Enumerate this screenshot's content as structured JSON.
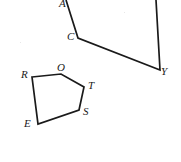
{
  "figure": {
    "background_color": "#ffffff",
    "stroke_color": "#1a1a1a",
    "label_color": "#1a1a1a",
    "width": 181,
    "height": 162,
    "shapes": [
      {
        "name": "upper-quadrilateral",
        "type": "polyline-open",
        "description": "Partial quadrilateral whose top side is cut off by the image edge",
        "points": "66,0 78,38 160,70 156,0",
        "closed": false
      },
      {
        "name": "lower-pentagon",
        "type": "polygon",
        "description": "Closed pentagon labelled R, O, T, S, E",
        "points": "32,77 61,74 84,87 79,110 38,124",
        "closed": true
      }
    ],
    "labels": [
      {
        "id": "A",
        "text": "A",
        "x": 59,
        "y": -2,
        "shape": "upper-quadrilateral"
      },
      {
        "id": "C",
        "text": "C",
        "x": 67,
        "y": 31,
        "shape": "upper-quadrilateral"
      },
      {
        "id": "Y",
        "text": "Y",
        "x": 161,
        "y": 66,
        "shape": "upper-quadrilateral"
      },
      {
        "id": "R",
        "text": "R",
        "x": 21,
        "y": 69,
        "shape": "lower-pentagon"
      },
      {
        "id": "O",
        "text": "O",
        "x": 57,
        "y": 62,
        "shape": "lower-pentagon"
      },
      {
        "id": "T",
        "text": "T",
        "x": 88,
        "y": 80,
        "shape": "lower-pentagon"
      },
      {
        "id": "S",
        "text": "S",
        "x": 83,
        "y": 106,
        "shape": "lower-pentagon"
      },
      {
        "id": "E",
        "text": "E",
        "x": 24,
        "y": 118,
        "shape": "lower-pentagon"
      }
    ],
    "specks": [
      {
        "x": 20,
        "y": 42
      },
      {
        "x": 124,
        "y": 12
      }
    ]
  }
}
